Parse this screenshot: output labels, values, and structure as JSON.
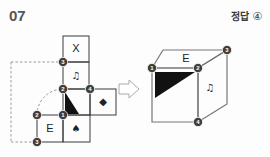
{
  "header": {
    "question_number": "07",
    "answer_prefix": "정답",
    "answer_choice": "④"
  },
  "net": {
    "title": "cube-net",
    "cells": [
      {
        "id": "cell-x",
        "glyph": "X",
        "type": "letter",
        "col": 1,
        "row": 0
      },
      {
        "id": "cell-note",
        "glyph": "♫",
        "type": "symbol",
        "col": 1,
        "row": 1
      },
      {
        "id": "cell-triangle",
        "glyph": "",
        "type": "triangle",
        "col": 1,
        "row": 2
      },
      {
        "id": "cell-diamond",
        "glyph": "◆",
        "type": "symbol",
        "col": 2,
        "row": 2
      },
      {
        "id": "cell-e",
        "glyph": "E",
        "type": "letter",
        "col": 0,
        "row": 3
      },
      {
        "id": "cell-spade",
        "glyph": "♠",
        "type": "symbol",
        "col": 1,
        "row": 3
      }
    ],
    "vertices": [
      {
        "label": "3",
        "x": 63,
        "y": 62
      },
      {
        "label": "2",
        "x": 63,
        "y": 89
      },
      {
        "label": "4",
        "x": 90,
        "y": 89
      },
      {
        "label": "1",
        "x": 63,
        "y": 115
      },
      {
        "label": "2",
        "x": 37,
        "y": 115
      },
      {
        "label": "3",
        "x": 37,
        "y": 142
      }
    ]
  },
  "arrow": {
    "label": "transform-arrow"
  },
  "cube": {
    "title": "folded-cube",
    "faces": [
      {
        "id": "front-face",
        "glyph": "",
        "type": "triangle"
      },
      {
        "id": "top-face",
        "glyph": "E",
        "type": "letter"
      },
      {
        "id": "side-face",
        "glyph": "♫",
        "type": "symbol"
      }
    ],
    "vertices": [
      {
        "label": "1",
        "x": 152,
        "y": 68
      },
      {
        "label": "2",
        "x": 198,
        "y": 68
      },
      {
        "label": "3",
        "x": 227,
        "y": 50
      },
      {
        "label": "4",
        "x": 198,
        "y": 122
      }
    ]
  },
  "colors": {
    "ink": "#3a3a3a",
    "fill_black": "#111111",
    "guide": "#9a9a9a",
    "background": "#fdfdfd"
  }
}
